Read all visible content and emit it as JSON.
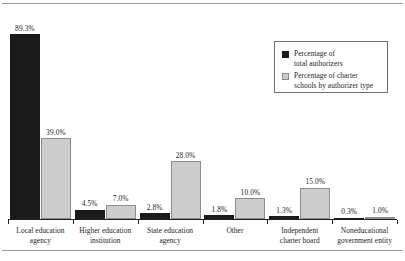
{
  "chart_data": {
    "type": "bar",
    "title": "",
    "xlabel": "",
    "ylabel": "",
    "ylim": [
      0,
      100
    ],
    "grid": false,
    "legend_position": "top-right",
    "categories": [
      "Local education agency",
      "Higher education institution",
      "State education agency",
      "Other",
      "Independent charter board",
      "Noneducational government entity"
    ],
    "category_lines": [
      [
        "Local education",
        "agency"
      ],
      [
        "Higher education",
        "institution"
      ],
      [
        "State education",
        "agency"
      ],
      [
        "Other"
      ],
      [
        "Independent",
        "charter board"
      ],
      [
        "Noneducational",
        "government entity"
      ]
    ],
    "series": [
      {
        "name": "Percentage of total authorizers",
        "color": "#1a1a1a",
        "values": [
          89.3,
          4.5,
          2.8,
          1.8,
          1.3,
          0.3
        ],
        "labels": [
          "89.3%",
          "4.5%",
          "2.8%",
          "1.8%",
          "1.3%",
          "0.3%"
        ]
      },
      {
        "name": "Percentage of charter schools by authorizer type",
        "color": "#cdcdcd",
        "values": [
          39.0,
          7.0,
          28.0,
          10.0,
          15.0,
          1.0
        ],
        "labels": [
          "39.0%",
          "7.0%",
          "28.0%",
          "10.0%",
          "15.0%",
          "1.0%"
        ]
      }
    ]
  },
  "legend": {
    "entries": [
      {
        "label": "Percentage of\ntotal authorizers",
        "swatch": "dark"
      },
      {
        "label": "Percentage of charter\nschools by authorizer type",
        "swatch": "light"
      }
    ]
  }
}
